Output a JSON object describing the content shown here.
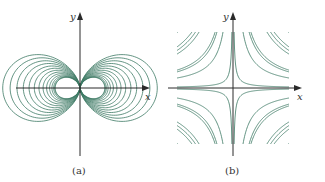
{
  "figure": {
    "line_color": "#3e7a64",
    "dense_color": "#1f5e48",
    "axis_color": "#2a2a2a",
    "panels": [
      {
        "id": "a",
        "caption": "(a)",
        "x_label": "x",
        "y_label": "y",
        "description": "Dipole field-line loops tangent to the y-axis at the origin, mirrored on both sides",
        "curve_family": "r = c·cos²θ",
        "loop_count_per_side": 14
      },
      {
        "id": "b",
        "caption": "(b)",
        "x_label": "x",
        "y_label": "y",
        "description": "Hyperbolic level curves xy = k in all four quadrants, clipped to a square",
        "curve_family": "xy = k",
        "curves_per_quadrant": 6
      }
    ]
  }
}
